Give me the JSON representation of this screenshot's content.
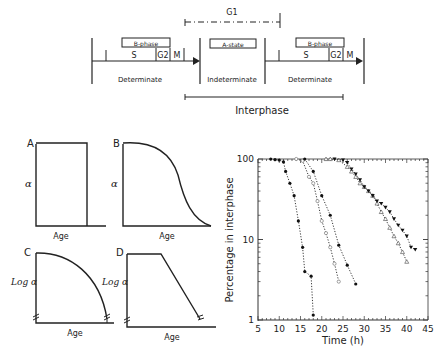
{
  "cell_cycle": {
    "g1_label": "G1",
    "left_box": "B-phase",
    "center_box": "A-state",
    "right_box": "B-phase",
    "s_label": "S",
    "g2_label": "G2",
    "m_label": "M",
    "determinate_left": "Determinate",
    "indeterminate": "Indeterminate",
    "determinate_right": "Determinate",
    "interphase": "Interphase"
  },
  "panels": {
    "a": {
      "letter": "A",
      "ylabel": "α",
      "xlabel": "Age"
    },
    "b": {
      "letter": "B",
      "ylabel": "α",
      "xlabel": "Age"
    },
    "c": {
      "letter": "C",
      "ylabel": "Log α",
      "xlabel": "Age"
    },
    "d": {
      "letter": "D",
      "ylabel": "Log α",
      "xlabel": "Age"
    }
  },
  "chart_data": {
    "type": "scatter",
    "title": "",
    "xlabel": "Time (h)",
    "ylabel": "Percentage in interphase",
    "xlim": [
      5,
      45
    ],
    "ylim": [
      1,
      100
    ],
    "yscale": "log",
    "x_ticks": [
      "5",
      "10",
      "15",
      "20",
      "25",
      "30",
      "35",
      "40",
      "45"
    ],
    "y_ticks": [
      "1",
      "10",
      "100"
    ],
    "series": [
      {
        "name": "series-1 (filled circles)",
        "marker": "filled-circle",
        "x": [
          8,
          9,
          10,
          11,
          11.5,
          12.5,
          13.5,
          14.5,
          15.5,
          16,
          17.5,
          18
        ],
        "y": [
          100,
          98,
          97,
          92,
          70,
          50,
          35,
          17,
          8,
          4,
          3.5,
          1.15
        ]
      },
      {
        "name": "series-2 (open circles)",
        "marker": "open-circle",
        "x": [
          14,
          15.5,
          17,
          18,
          19,
          20,
          21,
          22,
          23,
          24
        ],
        "y": [
          100,
          95,
          60,
          50,
          30,
          17,
          12,
          8,
          5,
          3
        ]
      },
      {
        "name": "series-3 (filled diamonds)",
        "marker": "filled-circle",
        "x": [
          16,
          18,
          20,
          22,
          24,
          26,
          28
        ],
        "y": [
          100,
          70,
          35,
          20,
          8.5,
          4.8,
          2.8
        ]
      },
      {
        "name": "series-4 (open triangles)",
        "marker": "open-triangle",
        "x": [
          21,
          22,
          24,
          26,
          27,
          28,
          29,
          30,
          31,
          32,
          33,
          34,
          35,
          36,
          37,
          38,
          39,
          40
        ],
        "y": [
          100,
          100,
          97,
          80,
          70,
          60,
          50,
          45,
          40,
          35,
          28,
          22,
          18,
          14,
          11,
          9,
          7,
          5.3
        ]
      },
      {
        "name": "series-5 (filled inverted triangles)",
        "marker": "filled-down-triangle",
        "x": [
          23,
          25,
          26,
          27,
          28,
          29,
          30,
          31,
          32,
          33,
          34,
          35,
          36,
          37,
          38,
          39,
          40,
          41,
          42
        ],
        "y": [
          100,
          97,
          90,
          75,
          65,
          55,
          45,
          40,
          35,
          30,
          28,
          25,
          22,
          18,
          15,
          13,
          11,
          8,
          7.5
        ]
      }
    ]
  }
}
